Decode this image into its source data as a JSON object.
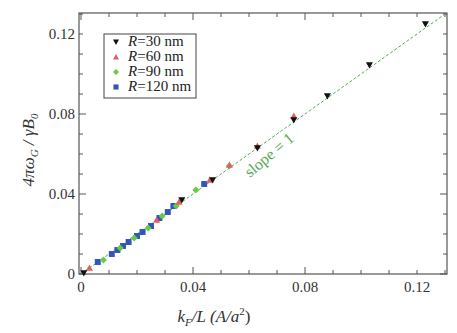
{
  "chart_data": {
    "type": "scatter",
    "title": "",
    "xlabel": "k_F/L (A/a²)",
    "ylabel": "4πω_G / γB_0",
    "xlim": [
      0,
      0.13
    ],
    "ylim": [
      0,
      0.13
    ],
    "xticks": [
      "0",
      "0.04",
      "0.08",
      "0.12"
    ],
    "yticks": [
      "0",
      "0.04",
      "0.08",
      "0.12"
    ],
    "grid": false,
    "legend_position": "upper left",
    "annotation": "slope = 1",
    "series": [
      {
        "name": "R=30 nm",
        "marker": "triangle-down",
        "color": "#111111",
        "x": [
          0.001,
          0.036,
          0.047,
          0.063,
          0.076,
          0.088,
          0.103,
          0.123
        ],
        "y": [
          0.0005,
          0.037,
          0.047,
          0.063,
          0.077,
          0.089,
          0.1045,
          0.125
        ]
      },
      {
        "name": "R=60 nm",
        "marker": "triangle-up",
        "color": "#e06060",
        "x": [
          0.003,
          0.027,
          0.035,
          0.046,
          0.053,
          0.063,
          0.076
        ],
        "y": [
          0.003,
          0.027,
          0.036,
          0.047,
          0.0545,
          0.064,
          0.079
        ]
      },
      {
        "name": "R=90 nm",
        "marker": "diamond",
        "color": "#66cc44",
        "x": [
          0.008,
          0.014,
          0.019,
          0.024,
          0.029,
          0.034,
          0.041,
          0.053
        ],
        "y": [
          0.007,
          0.013,
          0.018,
          0.023,
          0.029,
          0.034,
          0.042,
          0.054
        ]
      },
      {
        "name": "R=120 nm",
        "marker": "square",
        "color": "#3355bb",
        "x": [
          0.006,
          0.011,
          0.013,
          0.015,
          0.017,
          0.02,
          0.022,
          0.025,
          0.028,
          0.031,
          0.033,
          0.044
        ],
        "y": [
          0.006,
          0.01,
          0.012,
          0.014,
          0.016,
          0.019,
          0.021,
          0.024,
          0.028,
          0.031,
          0.034,
          0.045
        ]
      }
    ],
    "reference_line": {
      "label": "slope = 1",
      "style": "dashed",
      "color": "#55aa55",
      "from": [
        0,
        0
      ],
      "to": [
        0.13,
        0.13
      ]
    }
  },
  "legend": {
    "items": [
      {
        "label": "R=30 nm",
        "prefix": "R",
        "rest": "=30 nm"
      },
      {
        "label": "R=60 nm",
        "prefix": "R",
        "rest": "=60 nm"
      },
      {
        "label": "R=90 nm",
        "prefix": "R",
        "rest": "=90 nm"
      },
      {
        "label": "R=120 nm",
        "prefix": "R",
        "rest": "=120 nm"
      }
    ]
  },
  "axes": {
    "x_label_k": "k",
    "x_label_sub": "F",
    "x_label_rest": "/L (",
    "x_label_A": "A/a",
    "x_label_sup": "2",
    "x_label_close": ")",
    "y_label_main": "4πω",
    "y_label_sub1": "G",
    "y_label_mid": " / γB",
    "y_label_sub2": "0"
  }
}
